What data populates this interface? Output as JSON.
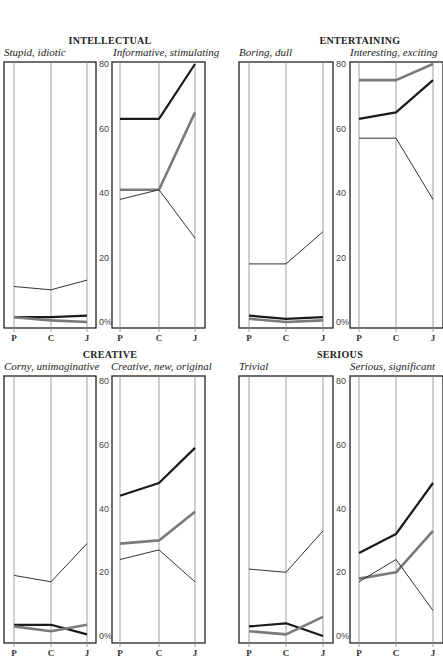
{
  "chart_data": [
    {
      "type": "line",
      "group": "INTELLECTUAL",
      "panels": [
        {
          "title": "Stupid, idiotic",
          "categories": [
            "P",
            "C",
            "J"
          ],
          "series": [
            {
              "name": "thin",
              "values": [
                11,
                10,
                13
              ]
            },
            {
              "name": "black",
              "values": [
                1.5,
                1.5,
                2
              ]
            },
            {
              "name": "gray",
              "values": [
                1.5,
                0.5,
                0
              ]
            }
          ]
        },
        {
          "title": "Informative, stimulating",
          "categories": [
            "P",
            "C",
            "J"
          ],
          "series": [
            {
              "name": "black",
              "values": [
                63,
                63,
                80
              ]
            },
            {
              "name": "gray",
              "values": [
                41,
                41,
                65
              ]
            },
            {
              "name": "thin",
              "values": [
                38,
                41,
                26
              ]
            }
          ]
        }
      ],
      "ylim": [
        0,
        80
      ],
      "yticks": [
        "0%",
        "20",
        "40",
        "60",
        "80"
      ]
    },
    {
      "type": "line",
      "group": "ENTERTAINING",
      "panels": [
        {
          "title": "Boring, dull",
          "categories": [
            "P",
            "C",
            "J"
          ],
          "series": [
            {
              "name": "thin",
              "values": [
                18,
                18,
                28
              ]
            },
            {
              "name": "black",
              "values": [
                2,
                1,
                1.5
              ]
            },
            {
              "name": "gray",
              "values": [
                1,
                0,
                0.5
              ]
            }
          ]
        },
        {
          "title": "Interesting, exciting",
          "categories": [
            "P",
            "C",
            "J"
          ],
          "series": [
            {
              "name": "gray",
              "values": [
                75,
                75,
                80
              ]
            },
            {
              "name": "black",
              "values": [
                63,
                65,
                75
              ]
            },
            {
              "name": "thin",
              "values": [
                57,
                57,
                38
              ]
            }
          ]
        }
      ],
      "ylim": [
        0,
        80
      ],
      "yticks": [
        "0%",
        "20",
        "40",
        "60",
        "80"
      ]
    },
    {
      "type": "line",
      "group": "CREATIVE",
      "panels": [
        {
          "title": "Corny, unimaginative",
          "categories": [
            "P",
            "C",
            "J"
          ],
          "series": [
            {
              "name": "thin",
              "values": [
                19,
                17,
                29
              ]
            },
            {
              "name": "black",
              "values": [
                3.5,
                3.5,
                0.5
              ]
            },
            {
              "name": "gray",
              "values": [
                3,
                1.5,
                3.5
              ]
            }
          ]
        },
        {
          "title": "Creative, new, original",
          "categories": [
            "P",
            "C",
            "J"
          ],
          "series": [
            {
              "name": "black",
              "values": [
                44,
                48,
                59
              ]
            },
            {
              "name": "gray",
              "values": [
                29,
                30,
                39
              ]
            },
            {
              "name": "thin",
              "values": [
                24,
                27,
                17
              ]
            }
          ]
        }
      ],
      "ylim": [
        0,
        80
      ],
      "yticks": [
        "0%",
        "20",
        "40",
        "60",
        "80"
      ]
    },
    {
      "type": "line",
      "group": "SERIOUS",
      "panels": [
        {
          "title": "Trivial",
          "categories": [
            "P",
            "C",
            "J"
          ],
          "series": [
            {
              "name": "thin",
              "values": [
                21,
                20,
                33
              ]
            },
            {
              "name": "black",
              "values": [
                3,
                4,
                0
              ]
            },
            {
              "name": "gray",
              "values": [
                1.5,
                0.5,
                6
              ]
            }
          ]
        },
        {
          "title": "Serious, significant",
          "categories": [
            "P",
            "C",
            "J"
          ],
          "series": [
            {
              "name": "black",
              "values": [
                26,
                32,
                48
              ]
            },
            {
              "name": "gray",
              "values": [
                18,
                20,
                33
              ]
            },
            {
              "name": "thin",
              "values": [
                17,
                24,
                8
              ]
            }
          ]
        }
      ],
      "ylim": [
        0,
        80
      ],
      "yticks": [
        "0%",
        "20",
        "40",
        "60",
        "80"
      ]
    }
  ],
  "labels": {
    "intellectual": "INTELLECTUAL",
    "intellectual_left": "Stupid, idiotic",
    "intellectual_right": "Informative, stimulating",
    "entertaining": "ENTERTAINING",
    "entertaining_left": "Boring, dull",
    "entertaining_right": "Interesting, exciting",
    "creative": "CREATIVE",
    "creative_left": "Corny, unimaginative",
    "creative_right": "Creative, new, original",
    "serious": "SERIOUS",
    "serious_left": "Trivial",
    "serious_right": "Serious, significant"
  },
  "series_styles": {
    "black": {
      "color": "#1a1a1a",
      "width": 2.2
    },
    "gray": {
      "color": "#7a7a7a",
      "width": 2.6
    },
    "thin": {
      "color": "#333333",
      "width": 1
    }
  }
}
